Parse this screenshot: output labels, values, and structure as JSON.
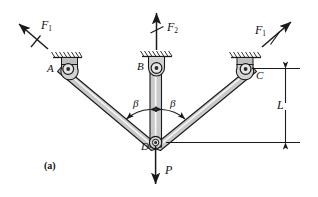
{
  "figure": {
    "caption": "(a)",
    "joints": [
      {
        "id": "A",
        "label": "A",
        "x": 68,
        "y": 69,
        "support": "pin-hatched-ground"
      },
      {
        "id": "B",
        "label": "B",
        "x": 157,
        "y": 68,
        "support": "pin-hatched-ground"
      },
      {
        "id": "C",
        "label": "C",
        "x": 246,
        "y": 69,
        "support": "pin-hatched-ground"
      },
      {
        "id": "D",
        "label": "D",
        "x": 155,
        "y": 142,
        "support": "pin-joint"
      }
    ],
    "members": [
      {
        "from": "A",
        "to": "D"
      },
      {
        "from": "B",
        "to": "D"
      },
      {
        "from": "C",
        "to": "D"
      }
    ],
    "forces": [
      {
        "name": "F1-left",
        "label": "F",
        "sub": "1",
        "direction": "up-left",
        "at": "A"
      },
      {
        "name": "F2-center",
        "label": "F",
        "sub": "2",
        "direction": "up",
        "at": "B"
      },
      {
        "name": "F1-right",
        "label": "F",
        "sub": "1",
        "direction": "up-right",
        "at": "C"
      },
      {
        "name": "P-load",
        "label": "P",
        "sub": "",
        "direction": "down",
        "at": "D"
      }
    ],
    "angles": [
      {
        "name": "beta-left",
        "label": "β",
        "between": [
          "AD",
          "BD"
        ]
      },
      {
        "name": "beta-right",
        "label": "β",
        "between": [
          "BD",
          "CD"
        ]
      }
    ],
    "dimensions": [
      {
        "name": "L",
        "label": "L",
        "orientation": "vertical",
        "from": "C",
        "to": "D-level"
      }
    ],
    "colors": {
      "member_fill": "#c9c9c9",
      "member_stroke": "#1a1a1a",
      "line": "#1a1a1a",
      "background": "#ffffff"
    }
  }
}
